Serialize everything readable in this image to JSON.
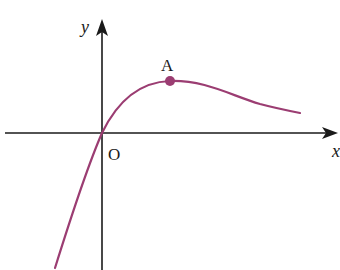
{
  "diagram": {
    "type": "function-graph",
    "axes": {
      "x_label": "x",
      "y_label": "y",
      "origin_label": "O",
      "axis_color": "#1a1a1a"
    },
    "curve": {
      "color": "#9b3d72",
      "description": "Curve passing through origin O, rising to a local maximum at point A, then decreasing toward the x-axis asymptotically as x increases; decreasing steeply to negative values for x < 0"
    },
    "points": [
      {
        "label": "A",
        "role": "local maximum",
        "color": "#9b3d72"
      }
    ]
  }
}
